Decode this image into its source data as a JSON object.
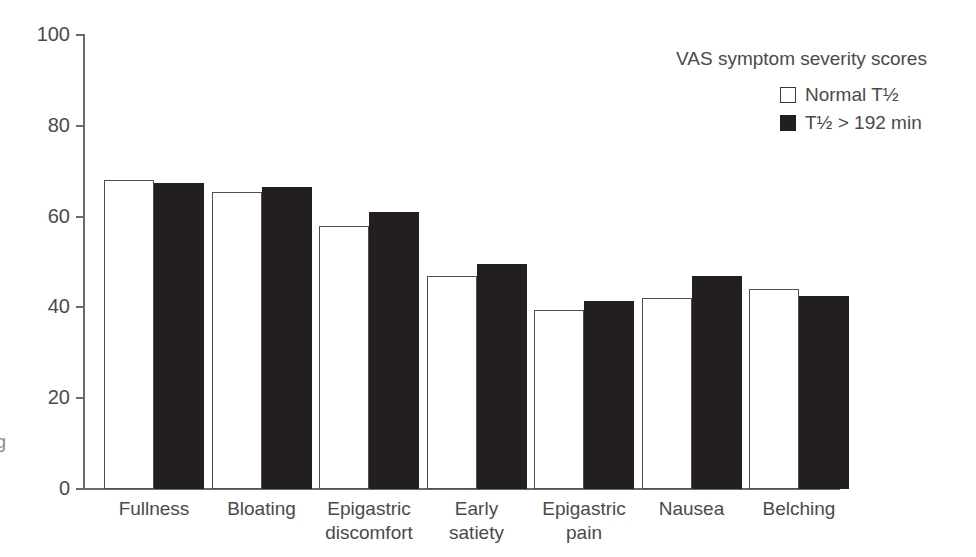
{
  "chart_data": {
    "type": "bar",
    "title": "",
    "xlabel": "",
    "ylabel": "",
    "ylim": [
      0,
      100
    ],
    "yticks": [
      0,
      20,
      40,
      60,
      80,
      100
    ],
    "grid": false,
    "legend_position": "top-right",
    "legend_title": "VAS symptom severity scores",
    "categories": [
      "Fullness",
      "Bloating",
      "Epigastric\ndiscomfort",
      "Early\nsatiety",
      "Epigastric\npain",
      "Nausea",
      "Belching"
    ],
    "series": [
      {
        "name": "Normal T½",
        "swatch": "open",
        "color": "#ffffff",
        "values": [
          68.0,
          65.5,
          58.0,
          47.0,
          39.5,
          42.0,
          44.0
        ]
      },
      {
        "name": "T½ > 192 min",
        "swatch": "filled",
        "color": "#231f20",
        "values": [
          67.5,
          66.5,
          61.0,
          49.5,
          41.5,
          47.0,
          42.5
        ]
      }
    ]
  },
  "axis": {
    "y_tick_labels": [
      "100",
      "80",
      "60",
      "40",
      "20",
      "0"
    ]
  },
  "legend": {
    "title": "VAS symptom severity scores",
    "items": [
      {
        "label": "Normal T½"
      },
      {
        "label": "T½ > 192 min"
      }
    ]
  },
  "side_label": "g"
}
